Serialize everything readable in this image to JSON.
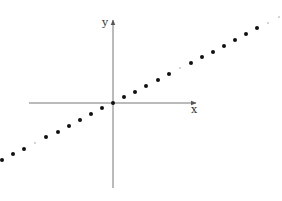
{
  "diagram": {
    "title": "",
    "axes": {
      "x_label": "x",
      "y_label": "y",
      "origin": [
        113,
        103
      ],
      "x_axis": {
        "from": [
          29,
          103
        ],
        "to": [
          196,
          103
        ]
      },
      "y_axis": {
        "from": [
          113,
          188
        ],
        "to": [
          113,
          20
        ]
      },
      "color": "#777777"
    },
    "colors": {
      "dot": "#111111",
      "faint_dot": "#888888",
      "background": "#ffffff"
    },
    "points": [
      {
        "x": 2,
        "y": 160,
        "size": "large"
      },
      {
        "x": 13,
        "y": 154,
        "size": "large"
      },
      {
        "x": 24,
        "y": 149,
        "size": "large"
      },
      {
        "x": 35,
        "y": 143,
        "size": "small"
      },
      {
        "x": 46,
        "y": 137,
        "size": "large"
      },
      {
        "x": 58,
        "y": 132,
        "size": "large"
      },
      {
        "x": 69,
        "y": 126,
        "size": "large"
      },
      {
        "x": 80,
        "y": 120,
        "size": "large"
      },
      {
        "x": 91,
        "y": 114,
        "size": "large"
      },
      {
        "x": 102,
        "y": 108,
        "size": "large"
      },
      {
        "x": 113,
        "y": 103,
        "size": "large"
      },
      {
        "x": 124,
        "y": 97,
        "size": "large"
      },
      {
        "x": 135,
        "y": 92,
        "size": "large"
      },
      {
        "x": 146,
        "y": 86,
        "size": "large"
      },
      {
        "x": 158,
        "y": 80,
        "size": "large"
      },
      {
        "x": 169,
        "y": 74,
        "size": "large"
      },
      {
        "x": 180,
        "y": 68,
        "size": "small"
      },
      {
        "x": 191,
        "y": 63,
        "size": "large"
      },
      {
        "x": 202,
        "y": 57,
        "size": "large"
      },
      {
        "x": 213,
        "y": 52,
        "size": "large"
      },
      {
        "x": 224,
        "y": 46,
        "size": "large"
      },
      {
        "x": 235,
        "y": 40,
        "size": "large"
      },
      {
        "x": 246,
        "y": 34,
        "size": "large"
      },
      {
        "x": 257,
        "y": 28,
        "size": "large"
      },
      {
        "x": 268,
        "y": 23,
        "size": "small"
      },
      {
        "x": 279,
        "y": 17,
        "size": "small"
      }
    ]
  }
}
